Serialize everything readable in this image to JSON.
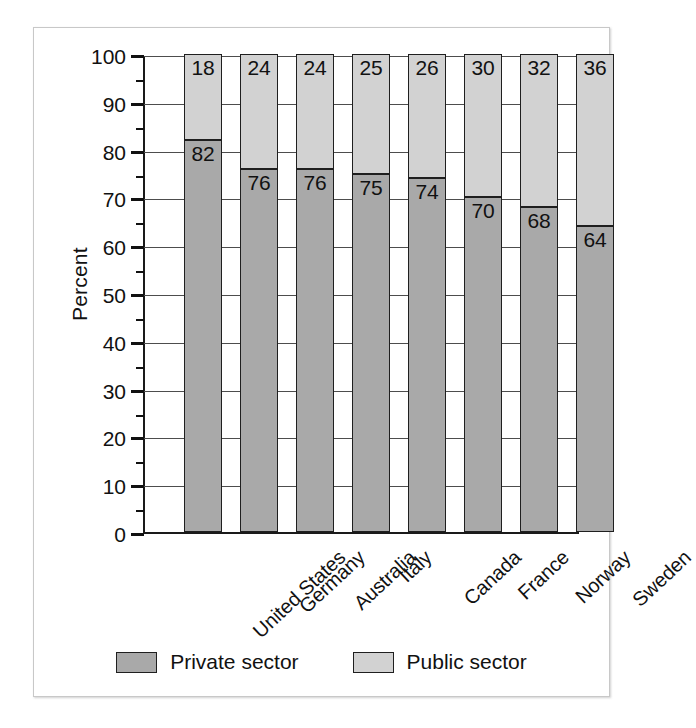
{
  "chart_data": {
    "type": "bar",
    "subtype": "stacked-bar-100",
    "title": "",
    "xlabel": "",
    "ylabel": "Percent",
    "ylim": [
      0,
      100
    ],
    "ytick_step": 10,
    "yticks": [
      "0",
      "10",
      "20",
      "30",
      "40",
      "50",
      "60",
      "70",
      "80",
      "90",
      "100"
    ],
    "grid": true,
    "legend_position": "bottom-center",
    "categories": [
      "United States",
      "Germany",
      "Australia",
      "Italy",
      "Canada",
      "France",
      "Norway",
      "Sweden"
    ],
    "series": [
      {
        "name": "Private sector",
        "color": "#a9a9a9",
        "values": [
          82,
          76,
          76,
          75,
          74,
          70,
          68,
          64
        ]
      },
      {
        "name": "Public sector",
        "color": "#d2d2d2",
        "values": [
          18,
          24,
          24,
          25,
          26,
          30,
          32,
          36
        ]
      }
    ]
  },
  "legend": {
    "entries": [
      {
        "label": "Private sector",
        "color": "#a9a9a9"
      },
      {
        "label": "Public sector",
        "color": "#d2d2d2"
      }
    ]
  },
  "colors": {
    "private": "#a9a9a9",
    "public": "#d2d2d2",
    "axis": "#111111",
    "grid": "#4d4d4d",
    "frame": "#c8c8c8",
    "background": "#ffffff"
  }
}
